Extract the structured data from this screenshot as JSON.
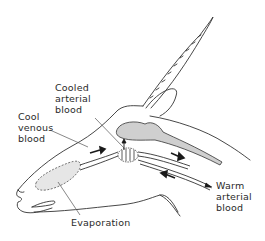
{
  "diagram": {
    "colors": {
      "line": "#333333",
      "shading": "#cfcfcf",
      "text": "#2a2a2a",
      "background": "#ffffff"
    },
    "labels": {
      "cooled_arterial": "Cooled\narterial\nblood",
      "cool_venous": "Cool\nvenous\nblood",
      "warm_arterial": "Warm\narterial\nblood",
      "evaporation": "Evaporation"
    },
    "arrows": [
      {
        "name": "venous-flow-arrow",
        "direction": "right"
      },
      {
        "name": "cooled-arterial-flow-arrow",
        "direction": "right-down"
      },
      {
        "name": "warm-arterial-flow-arrow",
        "direction": "left-up"
      },
      {
        "name": "brain-supply-arrow",
        "direction": "up"
      }
    ]
  }
}
